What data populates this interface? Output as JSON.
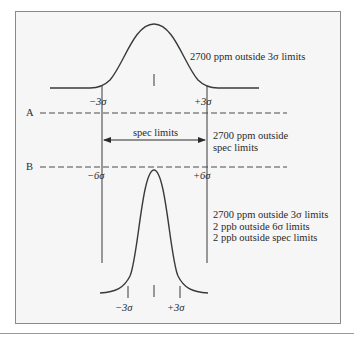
{
  "diagram": {
    "type": "six-sigma-distribution-comparison",
    "colors": {
      "frame_bg": "#f6f6f6",
      "stroke": "#3a3a3a",
      "border": "#8a8a8a"
    },
    "top_distribution": {
      "note": "2700 ppm outside 3σ limits",
      "left_tick_label": "−3σ",
      "right_tick_label": "+3σ"
    },
    "level_a_label": "A",
    "level_b_label": "B",
    "spec_arrow": {
      "label": "spec limits",
      "note_line1": "2700 ppm outside",
      "note_line2": "spec limits"
    },
    "bottom_distribution": {
      "left_limit_label": "−6σ",
      "right_limit_label": "+6σ",
      "notes": [
        "2700 ppm outside 3σ limits",
        "2 ppb outside 6σ limits",
        "2 ppb outside spec limits"
      ],
      "left_tick_label": "−3σ",
      "right_tick_label": "+3σ"
    }
  }
}
